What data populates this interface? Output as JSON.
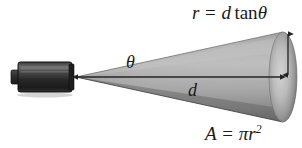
{
  "figure": {
    "background_color": "#ffffff",
    "width": 302,
    "height": 148
  },
  "labels": {
    "radius_formula": {
      "full_text": "r = d tanθ",
      "var_r": "r",
      "equals": "=",
      "var_d": "d",
      "function_tan": "tan",
      "var_theta": "θ"
    },
    "area_formula": {
      "full_text": "A = πr²",
      "var_A": "A",
      "equals": "=",
      "const_pi": "π",
      "var_r": "r",
      "exponent": "2"
    },
    "angle": {
      "symbol": "θ",
      "meaning": "divergence-angle"
    },
    "distance": {
      "symbol": "d",
      "meaning": "distance-to-target"
    }
  },
  "elements": {
    "emitter": {
      "name": "laser emitter",
      "body_color_dark": "#2b2b2b",
      "body_color_light": "#6f6f6f",
      "outline_color": "#111111"
    },
    "cone": {
      "name": "beam cone",
      "fill_light": "#b9b9b9",
      "fill_mid": "#9d9d9d",
      "fill_dark": "#6e6e6e",
      "edge_dark": "#575757"
    },
    "spot": {
      "name": "beam spot ellipse",
      "highlight": "#cfcfcf",
      "rim": "#7a7a7a"
    },
    "axis_arrow": {
      "name": "distance axis arrow",
      "color": "#2a2a2a",
      "heads": "both"
    },
    "radius_arrow": {
      "name": "radius arrow",
      "color": "#2a2a2a",
      "heads": "both"
    }
  }
}
